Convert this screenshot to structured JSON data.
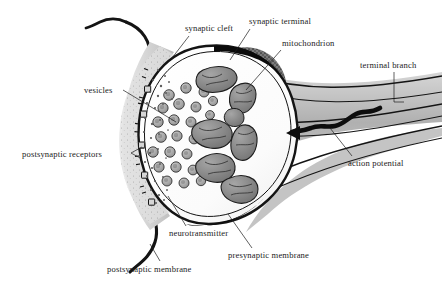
{
  "figure": {
    "background_color": "#ffffff",
    "ink_color": "#1b1b1b",
    "width": 442,
    "height": 288
  },
  "labels": {
    "synaptic_cleft": "synaptic cleft",
    "synaptic_terminal": "synaptic terminal",
    "mitochondrion": "mitochondrion",
    "terminal_branch": "terminal branch",
    "vesicles": "vesicles",
    "postsynaptic_receptors": "postsynaptic receptors",
    "action_potential": "action potential",
    "neurotransmitter": "neurotransmitter",
    "presynaptic_membrane": "presynaptic membrane",
    "postsynaptic_membrane": "postsynaptic membrane"
  },
  "structures": {
    "bouton": {
      "name": "synaptic terminal bouton",
      "fill": "#fdfdfd",
      "membrane_color": "#141414"
    },
    "axon": {
      "name": "terminal branch axon",
      "fill": "#b9b9b9"
    },
    "cleft": {
      "name": "synaptic cleft",
      "fill": "#d8d8d8"
    },
    "postsynaptic_cell": {
      "name": "postsynaptic membrane",
      "fill": "#cfcfcf"
    },
    "vesicle": {
      "count": 24,
      "fill": "#a9a9a9",
      "stroke": "#2a2a2a",
      "radius": 5.2
    },
    "mitochondrion": {
      "count": 7,
      "fill": "#8f8f8f",
      "stroke": "#1f1f1f"
    },
    "receptor": {
      "count": 5,
      "fill": "#d2d2d2",
      "stroke": "#1c1c1c"
    },
    "neurotransmitter_dots": {
      "count": 34,
      "fill": "#6d6d6d"
    },
    "action_potential_arrow": {
      "direction": "leftward",
      "color": "#0d0d0d"
    }
  }
}
